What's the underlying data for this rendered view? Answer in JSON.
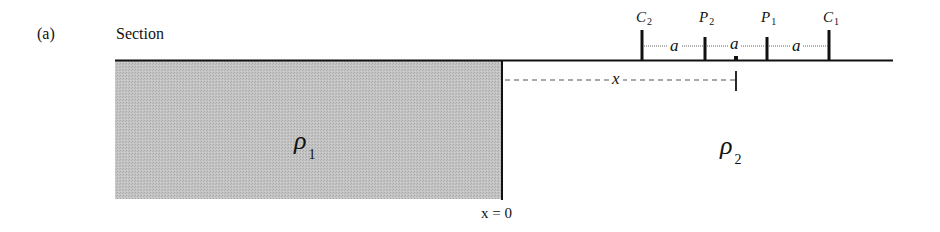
{
  "figure": {
    "panel_label": "(a)",
    "title": "Section",
    "colors": {
      "line": "#111111",
      "medium_1_fill": "#bdbdbd",
      "background": "#ffffff",
      "dashed": "#555555"
    }
  },
  "electrodes": [
    {
      "id": "C2",
      "symbol": "C",
      "subscript": "2"
    },
    {
      "id": "P2",
      "symbol": "P",
      "subscript": "2"
    },
    {
      "id": "P1",
      "symbol": "P",
      "subscript": "1"
    },
    {
      "id": "C1",
      "symbol": "C",
      "subscript": "1"
    }
  ],
  "spacings": [
    "a",
    "a",
    "a"
  ],
  "distance": {
    "label": "x",
    "description": "distance from contact to array midpoint"
  },
  "media": [
    {
      "id": "rho1",
      "symbol": "ρ",
      "subscript": "1",
      "shaded": true
    },
    {
      "id": "rho2",
      "symbol": "ρ",
      "subscript": "2",
      "shaded": false
    }
  ],
  "origin_label": "x = 0"
}
